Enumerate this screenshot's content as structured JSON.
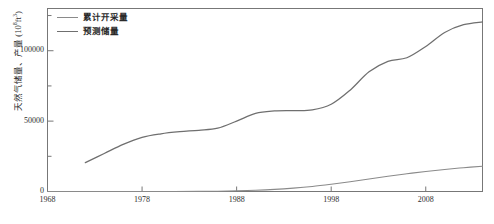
{
  "chart_data": {
    "type": "line",
    "title": "",
    "xlabel": "",
    "ylabel": "天然气储量、产量 (10⁸ft³)",
    "ylabel_main": "天然气储量、产量",
    "ylabel_unit_base": "(10",
    "ylabel_unit_sup": "8",
    "ylabel_unit_tail": "ft",
    "ylabel_unit_sup2": "3",
    "ylabel_unit_close": ")",
    "xlim": [
      1968,
      2014
    ],
    "ylim": [
      0,
      130000
    ],
    "xticks": [
      1968,
      1978,
      1988,
      1998,
      2008
    ],
    "xtick_labels": [
      "1968",
      "1978",
      "1988",
      "1998",
      "2008"
    ],
    "yticks": [
      0,
      50000,
      100000
    ],
    "ytick_labels": [
      "0",
      "50000",
      "100000"
    ],
    "yminor_ticks": [
      25000,
      75000,
      125000
    ],
    "grid": false,
    "legend_position": "top-left",
    "series": [
      {
        "name": "累计开采量",
        "color": "#8a8a8a",
        "x": [
          1968,
          1972,
          1976,
          1980,
          1984,
          1986,
          1988,
          1990,
          1992,
          1994,
          1996,
          1998,
          2000,
          2002,
          2004,
          2006,
          2008,
          2010,
          2012,
          2014
        ],
        "values": [
          0,
          0,
          0,
          20,
          100,
          250,
          500,
          900,
          1500,
          2400,
          3600,
          5200,
          7000,
          8900,
          10800,
          12600,
          14200,
          15600,
          16900,
          18000
        ]
      },
      {
        "name": "预测储量",
        "color": "#6f6f6f",
        "x": [
          1972,
          1974,
          1976,
          1978,
          1980,
          1982,
          1984,
          1986,
          1988,
          1990,
          1992,
          1994,
          1996,
          1998,
          2000,
          2002,
          2004,
          2006,
          2008,
          2010,
          2012,
          2014
        ],
        "values": [
          20500,
          27000,
          33500,
          38500,
          41000,
          42500,
          43500,
          45000,
          50000,
          55500,
          57200,
          57500,
          58000,
          62000,
          72000,
          85000,
          92500,
          95000,
          103000,
          113000,
          118500,
          120500
        ]
      }
    ]
  },
  "legend": {
    "items": [
      {
        "label": "累计开采量",
        "color": "#8a8a8a"
      },
      {
        "label": "预测储量",
        "color": "#6f6f6f"
      }
    ]
  },
  "caption": {
    "text": ""
  }
}
